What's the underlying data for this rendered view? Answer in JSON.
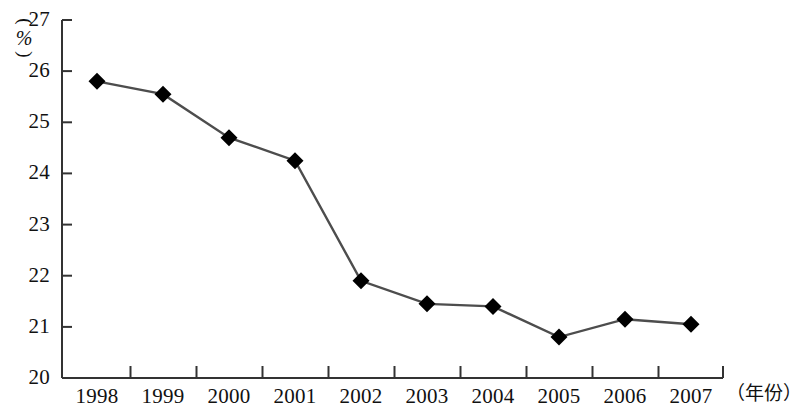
{
  "chart_data": {
    "type": "line",
    "title": "",
    "subtitle": "",
    "xlabel": "（年份）",
    "ylabel": "（%）",
    "ylabel_parts": {
      "paren_open": "(",
      "symbol": "%",
      "paren_close": ")"
    },
    "categories": [
      "1998",
      "1999",
      "2000",
      "2001",
      "2002",
      "2003",
      "2004",
      "2005",
      "2006",
      "2007"
    ],
    "values": [
      25.8,
      25.55,
      24.7,
      24.25,
      21.9,
      21.45,
      21.4,
      20.8,
      21.15,
      21.05
    ],
    "series": [
      {
        "name": "",
        "values": [
          25.8,
          25.55,
          24.7,
          24.25,
          21.9,
          21.45,
          21.4,
          20.8,
          21.15,
          21.05
        ]
      }
    ],
    "ylim": [
      20,
      27
    ],
    "yticks": [
      20,
      21,
      22,
      23,
      24,
      25,
      26,
      27
    ],
    "ytick_labels": [
      "20",
      "21",
      "22",
      "23",
      "24",
      "25",
      "26",
      "27"
    ],
    "xtick_labels": [
      "1998",
      "1999",
      "2000",
      "2001",
      "2002",
      "2003",
      "2004",
      "2005",
      "2006",
      "2007"
    ],
    "grid": false,
    "legend": false,
    "legend_position": "none",
    "marker": "diamond",
    "marker_color": "#000000",
    "line_color": "#4d4d4d",
    "axis_color": "#333333"
  },
  "axis": {
    "y_unit_label": "（%）",
    "x_unit_label": "（年份）"
  }
}
